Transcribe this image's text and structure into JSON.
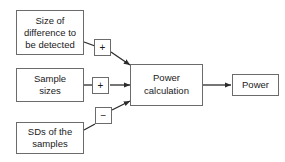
{
  "diagram": {
    "type": "flowchart",
    "background_color": "#ffffff",
    "box_border_color": "#6b6b6b",
    "connector_color": "#2b2b2b",
    "text_color": "#1a1a1a",
    "inputs": [
      {
        "id": "size-of-difference",
        "lines": [
          "Size of",
          "difference to",
          "be detected"
        ],
        "line1": "Size of",
        "line2": "difference to",
        "line3": "be detected",
        "operator": "+"
      },
      {
        "id": "sample-sizes",
        "lines": [
          "Sample",
          "sizes"
        ],
        "line1": "Sample",
        "line2": "sizes",
        "operator": "+"
      },
      {
        "id": "sds-of-samples",
        "lines": [
          "SDs of the",
          "samples"
        ],
        "line1": "SDs of the",
        "line2": "samples",
        "operator": "−"
      }
    ],
    "process": {
      "id": "power-calculation",
      "line1": "Power",
      "line2": "calculation"
    },
    "output": {
      "id": "power",
      "label": "Power"
    },
    "operators": {
      "plus": "+",
      "minus": "−"
    }
  }
}
